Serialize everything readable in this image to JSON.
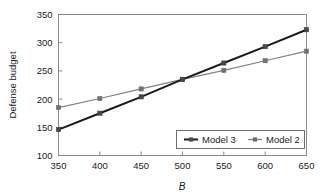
{
  "chart_data": {
    "type": "line",
    "title": "",
    "xlabel": "B",
    "ylabel": "Defense budget",
    "x": [
      350,
      400,
      450,
      500,
      550,
      600,
      650
    ],
    "xlim": [
      350,
      650
    ],
    "ylim": [
      100,
      350
    ],
    "xticks": [
      "350",
      "400",
      "450",
      "500",
      "550",
      "600",
      "650"
    ],
    "yticks": [
      "100",
      "150",
      "200",
      "250",
      "300",
      "350"
    ],
    "grid": false,
    "legend_position": "lower-right-inside",
    "series": [
      {
        "name": "Model 3",
        "color": "#1a1a1a",
        "marker": "square",
        "values": [
          146,
          175,
          204,
          235,
          264,
          293,
          323
        ]
      },
      {
        "name": "Model 2",
        "color": "#808080",
        "marker": "square",
        "values": [
          185,
          201,
          218,
          235,
          251,
          268,
          285
        ]
      }
    ]
  },
  "legend": {
    "entries": [
      {
        "label": "Model 3"
      },
      {
        "label": "Model 2"
      }
    ]
  },
  "axes": {
    "x_title": "B",
    "y_title": "Defense budget"
  }
}
